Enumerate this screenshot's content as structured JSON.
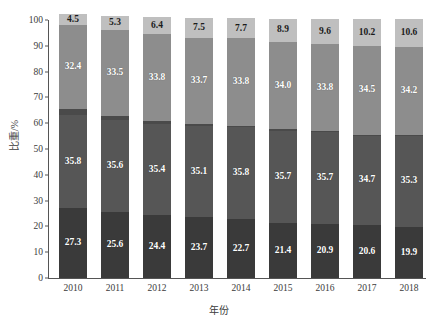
{
  "chart_data": {
    "type": "bar",
    "stacked": true,
    "title": "",
    "xlabel": "年份",
    "ylabel": "比重/%",
    "ylim": [
      0,
      100
    ],
    "yticks": [
      0,
      10,
      20,
      30,
      40,
      50,
      60,
      70,
      80,
      90,
      100
    ],
    "grid": false,
    "legend": "none",
    "categories": [
      "2010",
      "2011",
      "2012",
      "2013",
      "2014",
      "2015",
      "2016",
      "2017",
      "2018"
    ],
    "series": [
      {
        "name": "segment-1",
        "color": "#3a3a3a",
        "label_color": "light",
        "values": [
          27.3,
          25.6,
          24.4,
          23.7,
          22.7,
          21.4,
          20.9,
          20.6,
          19.9
        ],
        "labels": [
          "27.3",
          "25.6",
          "24.4",
          "23.7",
          "22.7",
          "21.4",
          "20.9",
          "20.6",
          "19.9"
        ]
      },
      {
        "name": "segment-2",
        "color": "#565656",
        "label_color": "light",
        "values": [
          35.8,
          35.6,
          35.4,
          35.1,
          35.8,
          35.7,
          35.7,
          34.7,
          35.3
        ],
        "labels": [
          "35.8",
          "35.6",
          "35.4",
          "35.1",
          "35.8",
          "35.7",
          "35.7",
          "34.7",
          "35.3"
        ]
      },
      {
        "name": "segment-3",
        "color": "#4a4a4a",
        "label_color": "light",
        "values": [
          2.5,
          1.5,
          1.0,
          0.7,
          0.6,
          0.5,
          0.4,
          0.3,
          0.3
        ],
        "labels": [
          "",
          "",
          "",
          "",
          "",
          "",
          "",
          "",
          ""
        ]
      },
      {
        "name": "segment-4",
        "color": "#8d8d8d",
        "label_color": "light",
        "values": [
          32.4,
          33.5,
          33.8,
          33.7,
          33.8,
          34.0,
          33.8,
          34.5,
          34.2
        ],
        "labels": [
          "32.4",
          "33.5",
          "33.8",
          "33.7",
          "33.8",
          "34.0",
          "33.8",
          "34.5",
          "34.2"
        ]
      },
      {
        "name": "segment-5",
        "color": "#bfbfbf",
        "label_color": "dark",
        "values": [
          4.5,
          5.3,
          6.4,
          7.5,
          7.7,
          8.9,
          9.6,
          10.2,
          10.6
        ],
        "labels": [
          "4.5",
          "5.3",
          "6.4",
          "7.5",
          "7.7",
          "8.9",
          "9.6",
          "10.2",
          "10.6"
        ]
      }
    ]
  },
  "axis": {
    "y_title": "比重/%",
    "x_title": "年份"
  }
}
